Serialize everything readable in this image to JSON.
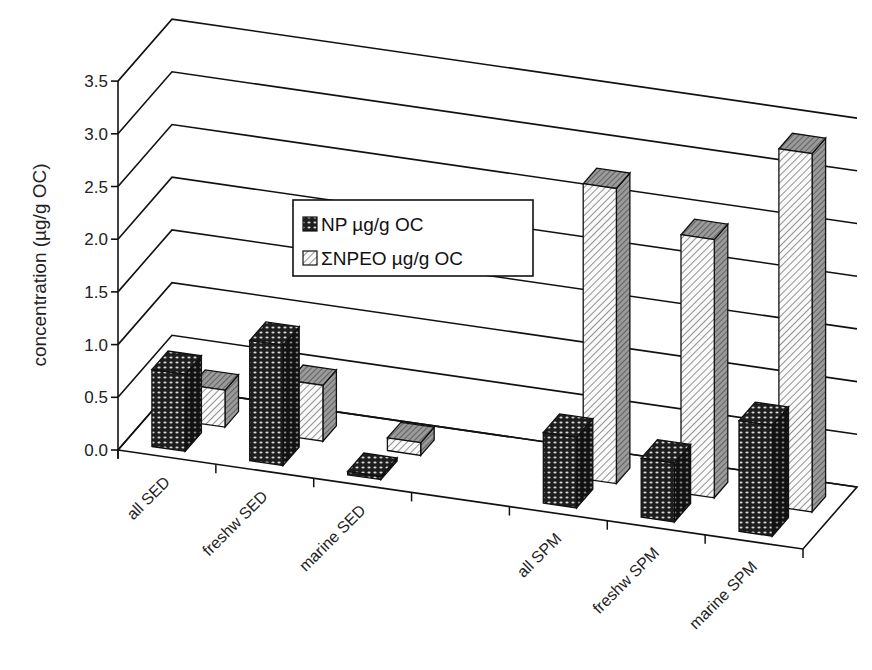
{
  "chart_data": {
    "type": "bar",
    "style": "3d-clustered-bar",
    "title": "",
    "xlabel": "",
    "ylabel": "concentration (µg/g OC)",
    "ylim": [
      0,
      3.5
    ],
    "yticks": [
      "0.0",
      "0.5",
      "1.0",
      "1.5",
      "2.0",
      "2.5",
      "3.0",
      "3.5"
    ],
    "grid": true,
    "legend_position": "inside-center-left",
    "categories": [
      "all SED",
      "freshw SED",
      "marine SED",
      "",
      "all SPM",
      "freshw SPM",
      "marine SPM"
    ],
    "series": [
      {
        "name": "NP µg/g OC",
        "pattern": "dark-checker",
        "values": [
          0.73,
          1.14,
          0.03,
          null,
          0.67,
          0.56,
          1.05
        ]
      },
      {
        "name": "ΣNPEO µg/g OC",
        "pattern": "light-hatch",
        "values": [
          0.35,
          0.53,
          0.12,
          null,
          2.8,
          2.45,
          3.4
        ]
      }
    ]
  },
  "legend": {
    "items": [
      {
        "label": "NP µg/g OC"
      },
      {
        "label": "ΣNPEO µg/g OC"
      }
    ]
  },
  "colors": {
    "np_fill": "#2a2a2a",
    "npeo_fill": "#f2f2f2",
    "side_shade": "#8a8a8a",
    "line": "#111111"
  }
}
